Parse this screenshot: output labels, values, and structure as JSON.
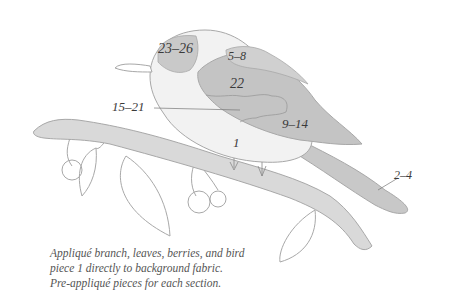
{
  "diagram": {
    "labels": [
      {
        "id": "head-cap",
        "text": "23–26",
        "x": 158,
        "y": 53
      },
      {
        "id": "shoulder",
        "text": "5–8",
        "x": 228,
        "y": 60
      },
      {
        "id": "wing-top",
        "text": "22",
        "x": 230,
        "y": 88
      },
      {
        "id": "wing-middle",
        "text": "15–21",
        "x": 112,
        "y": 111
      },
      {
        "id": "wing-lower",
        "text": "9–14",
        "x": 282,
        "y": 128
      },
      {
        "id": "body",
        "text": "1",
        "x": 233,
        "y": 147
      },
      {
        "id": "tail",
        "text": "2–4",
        "x": 394,
        "y": 179
      }
    ],
    "colors": {
      "outline": "#a8a8a8",
      "body_light": "#f2f2f2",
      "head_dark": "#c9c9c9",
      "wing_dark": "#c4c4c4",
      "branch": "#d9d9d9",
      "text": "#3a3a3a"
    }
  },
  "caption": {
    "line1": "Appliqué branch, leaves, berries, and bird",
    "line2": "piece 1 directly to background fabric.",
    "line3": "Pre-appliqué pieces for each section."
  }
}
